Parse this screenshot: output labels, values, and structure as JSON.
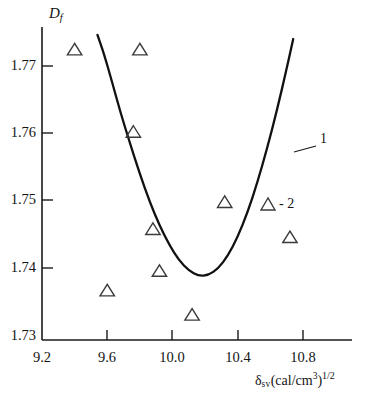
{
  "chart_data": {
    "type": "scatter",
    "title": "",
    "subtitle": "",
    "xlabel": "δ sv (cal/cm3)1/2",
    "xlabel_parts": {
      "symbol": "δ",
      "subscript": "sv",
      "unit_open": "(cal/cm",
      "unit_sup": "3",
      "unit_close": ")",
      "exponent": "1/2"
    },
    "ylabel": "Df",
    "ylabel_parts": {
      "symbol": "D",
      "subscript": "f"
    },
    "xlim": [
      9.2,
      11.0
    ],
    "ylim": [
      1.73,
      1.7755
    ],
    "grid": false,
    "legend_position": "inside-right",
    "xticks": [
      "9.2",
      "9.6",
      "10.0",
      "10.4",
      "10.8"
    ],
    "xtick_values": [
      9.2,
      9.6,
      10.0,
      10.4,
      10.8
    ],
    "yticks": [
      "1.73",
      "1.74",
      "1.75",
      "1.76",
      "1.77"
    ],
    "ytick_values": [
      1.73,
      1.74,
      1.75,
      1.76,
      1.77
    ],
    "series": [
      {
        "name": "1",
        "label": "1",
        "type": "line",
        "marker": "none",
        "color": "#111111",
        "annotation": "1",
        "points": [
          {
            "x": 9.54,
            "y": 1.7746
          },
          {
            "x": 9.58,
            "y": 1.7718
          },
          {
            "x": 9.63,
            "y": 1.7676
          },
          {
            "x": 9.68,
            "y": 1.7632
          },
          {
            "x": 9.74,
            "y": 1.7585
          },
          {
            "x": 9.8,
            "y": 1.754
          },
          {
            "x": 9.86,
            "y": 1.7499
          },
          {
            "x": 9.92,
            "y": 1.7464
          },
          {
            "x": 9.98,
            "y": 1.7435
          },
          {
            "x": 10.04,
            "y": 1.7412
          },
          {
            "x": 10.1,
            "y": 1.7397
          },
          {
            "x": 10.16,
            "y": 1.7389
          },
          {
            "x": 10.22,
            "y": 1.739
          },
          {
            "x": 10.28,
            "y": 1.74
          },
          {
            "x": 10.34,
            "y": 1.7419
          },
          {
            "x": 10.4,
            "y": 1.7447
          },
          {
            "x": 10.46,
            "y": 1.7483
          },
          {
            "x": 10.52,
            "y": 1.7527
          },
          {
            "x": 10.58,
            "y": 1.7578
          },
          {
            "x": 10.64,
            "y": 1.7634
          },
          {
            "x": 10.7,
            "y": 1.7696
          },
          {
            "x": 10.74,
            "y": 1.774
          }
        ]
      },
      {
        "name": "2",
        "label": "2",
        "type": "scatter",
        "marker": "triangle-up-open",
        "color": "#3b3b3b",
        "annotation": "- 2",
        "points": [
          {
            "x": 9.4,
            "y": 1.7725
          },
          {
            "x": 9.8,
            "y": 1.7725
          },
          {
            "x": 9.76,
            "y": 1.7603
          },
          {
            "x": 9.88,
            "y": 1.7459
          },
          {
            "x": 9.92,
            "y": 1.7397
          },
          {
            "x": 9.6,
            "y": 1.7368
          },
          {
            "x": 10.12,
            "y": 1.7332
          },
          {
            "x": 10.32,
            "y": 1.7499
          },
          {
            "x": 10.72,
            "y": 1.7447
          }
        ]
      }
    ],
    "annotations": [
      {
        "text": "1",
        "x": 10.7,
        "y": 1.7602,
        "leader": true
      },
      {
        "text": "- 2",
        "x": 10.42,
        "y": 1.7507,
        "marker": "triangle-up-open"
      }
    ]
  }
}
